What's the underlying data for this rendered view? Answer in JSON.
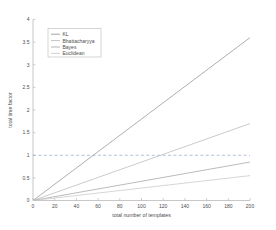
{
  "chart_data": {
    "type": "line",
    "title": "",
    "xlabel": "total number of templates",
    "ylabel": "total time factor",
    "xlim": [
      0,
      200
    ],
    "ylim": [
      0,
      4
    ],
    "xticks": [
      0,
      20,
      40,
      60,
      80,
      100,
      120,
      140,
      160,
      180,
      200
    ],
    "xticklabels": [
      "0",
      "20",
      "40",
      "60",
      "80",
      "100",
      "120",
      "140",
      "160",
      "180",
      "200"
    ],
    "yticks": [
      0,
      0.5,
      1,
      1.5,
      2,
      2.5,
      3,
      3.5,
      4
    ],
    "yticklabels": [
      "0",
      "0.5",
      "1",
      "1.5",
      "2",
      "2.5",
      "3",
      "3.5",
      "4"
    ],
    "grid": false,
    "legend_position": "upper left",
    "x": [
      0,
      200
    ],
    "series": [
      {
        "name": "KL",
        "values": [
          0,
          3.6
        ],
        "color": "#9a9a9a",
        "slope_per_template": 0.018
      },
      {
        "name": "Bhattacharyya",
        "values": [
          0,
          1.7
        ],
        "color": "#bdbdbd",
        "slope_per_template": 0.0085
      },
      {
        "name": "Bayes",
        "values": [
          0,
          0.85
        ],
        "color": "#aaaaaa",
        "slope_per_template": 0.00425
      },
      {
        "name": "Euclidean",
        "values": [
          0,
          0.55
        ],
        "color": "#cccccc",
        "slope_per_template": 0.00275
      }
    ],
    "reference_lines": [
      {
        "name": "unity-time-factor",
        "orientation": "horizontal",
        "value": 1,
        "style": "dashed",
        "color": "#8fa8c8"
      }
    ],
    "annotations": []
  },
  "legend": {
    "entries": [
      {
        "label": "KL"
      },
      {
        "label": "Bhattacharyya"
      },
      {
        "label": "Bayes"
      },
      {
        "label": "Euclidean"
      }
    ]
  }
}
